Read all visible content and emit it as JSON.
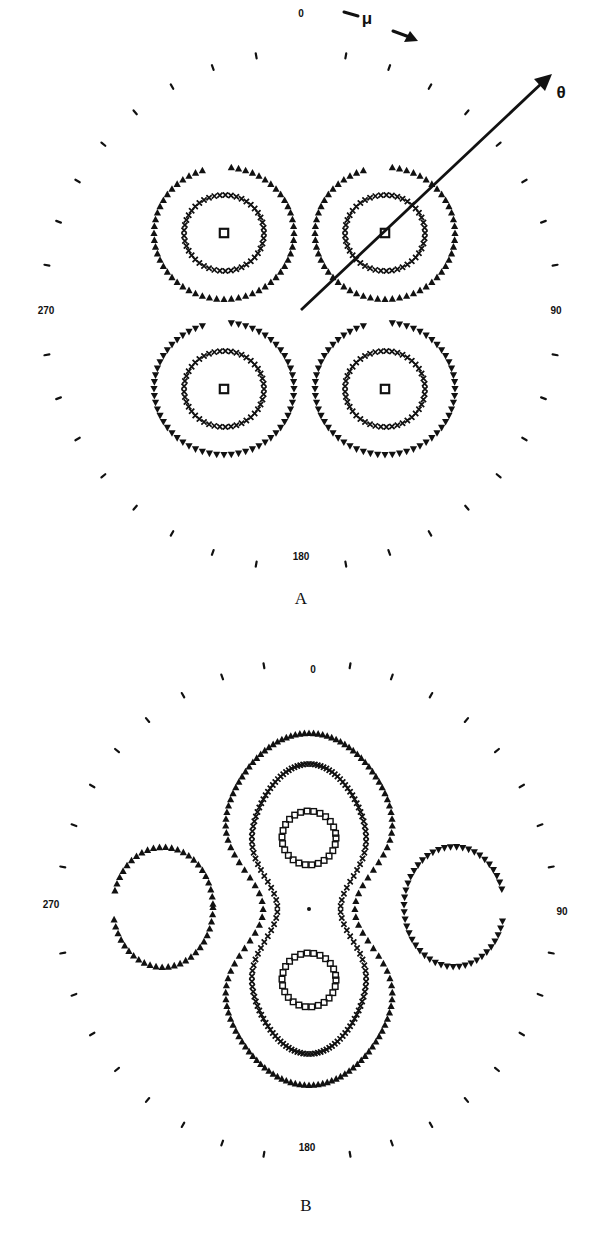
{
  "figure": {
    "panels": [
      {
        "id": "A",
        "label": "A",
        "center": [
          301,
          310
        ],
        "tick_radius": 258,
        "angle_labels": {
          "top": "0",
          "right": "90",
          "bottom": "180",
          "left": "270"
        },
        "annotations": {
          "mu_label": "μ",
          "theta_label": "θ"
        },
        "description": "Four-lobed angular distribution: four separate lobes in quadrants, each with a central square marker, an inner ring of × markers and an outer ring of triangle markers (upward triangles in top lobes, downward triangles in bottom lobes)."
      },
      {
        "id": "B",
        "label": "B",
        "center": [
          307,
          910
        ],
        "tick_radius": 248,
        "angle_labels": {
          "top": "0",
          "right": "90",
          "bottom": "180",
          "left": "270"
        },
        "description": "Hourglass / peanut-shaped nested contours: two central rings of square markers (top and bottom), nested × contour and triangle contour pinched at the equator, plus two side ovals of triangle markers at 90 and 270."
      }
    ],
    "marker_legend": {
      "square": "square-marker",
      "cross": "cross-marker",
      "triangle_up": "triangle-up-marker",
      "triangle_down": "triangle-down-marker"
    },
    "colors": {
      "ink": "#111111",
      "background": "#ffffff"
    }
  }
}
